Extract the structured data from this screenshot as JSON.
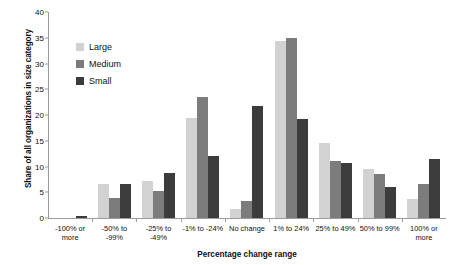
{
  "chart_data": {
    "type": "bar",
    "title": "",
    "xlabel": "Percentage change range",
    "ylabel": "Share of all organizations in size category",
    "ylim": [
      0,
      40
    ],
    "ytick_step": 5,
    "yticks": [
      0,
      5,
      10,
      15,
      20,
      25,
      30,
      35,
      40
    ],
    "grid": false,
    "legend_position": "upper-left-inside",
    "categories": [
      "-100% or more",
      "-50% to -99%",
      "-25% to -49%",
      "-1% to -24%",
      "No change",
      "1% to 24%",
      "25% to 49%",
      "50% to 99%",
      "100% or more"
    ],
    "series": [
      {
        "name": "Large",
        "color": "#d2d2d2",
        "values": [
          0,
          6.6,
          7.2,
          19.4,
          1.7,
          34.4,
          14.5,
          9.6,
          3.7
        ]
      },
      {
        "name": "Medium",
        "color": "#7c7c7c",
        "values": [
          0,
          3.8,
          5.3,
          23.5,
          3.3,
          35.0,
          11.0,
          8.6,
          6.7
        ]
      },
      {
        "name": "Small",
        "color": "#3c3c3c",
        "values": [
          0.4,
          6.7,
          8.7,
          12.1,
          21.8,
          19.2,
          10.6,
          6.0,
          11.4
        ]
      }
    ]
  }
}
